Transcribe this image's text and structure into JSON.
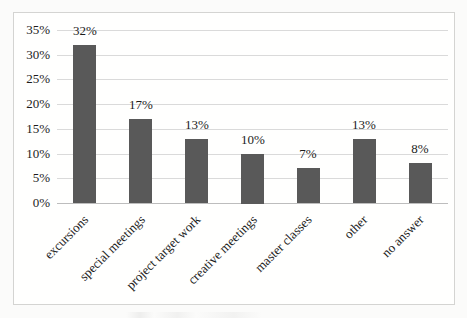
{
  "chart_data": {
    "type": "bar",
    "title": "",
    "xlabel": "",
    "ylabel": "",
    "categories": [
      "excursions",
      "special meetings",
      "project target work",
      "creative meetings",
      "master classes",
      "other",
      "no answer"
    ],
    "values": [
      32,
      17,
      13,
      10,
      7,
      13,
      8
    ],
    "data_labels": [
      "32%",
      "17%",
      "13%",
      "10%",
      "7%",
      "13%",
      "8%"
    ],
    "ylim": [
      0,
      35
    ],
    "yticks": [
      0,
      5,
      10,
      15,
      20,
      25,
      30,
      35
    ],
    "ytick_labels": [
      "0%",
      "5%",
      "10%",
      "15%",
      "20%",
      "25%",
      "30%",
      "35%"
    ],
    "grid": "horizontal",
    "legend_position": "none",
    "bar_color": "#595959",
    "gridline_color": "#dadada",
    "axis_line_color": "#bdbdbd",
    "frame_border_color": "#d4d4d2",
    "text_color": "#1c1c1c",
    "background_color": "#fffffe"
  }
}
